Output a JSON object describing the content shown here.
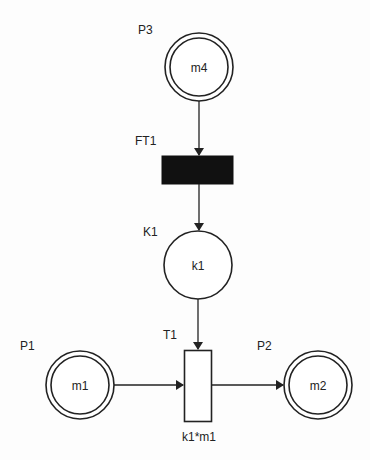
{
  "diagram": {
    "type": "petri-net",
    "places": [
      {
        "id": "P3",
        "label": "P3",
        "token": "m4",
        "double": true
      },
      {
        "id": "K1",
        "label": "K1",
        "token": "k1",
        "double": false
      },
      {
        "id": "P1",
        "label": "P1",
        "token": "m1",
        "double": true
      },
      {
        "id": "P2",
        "label": "P2",
        "token": "m2",
        "double": true
      }
    ],
    "transitions": [
      {
        "id": "FT1",
        "label": "FT1",
        "filled": true,
        "rate": ""
      },
      {
        "id": "T1",
        "label": "T1",
        "filled": false,
        "rate": "k1*m1"
      }
    ],
    "arcs": [
      {
        "from": "P3",
        "to": "FT1"
      },
      {
        "from": "FT1",
        "to": "K1"
      },
      {
        "from": "K1",
        "to": "T1"
      },
      {
        "from": "P1",
        "to": "T1"
      },
      {
        "from": "T1",
        "to": "P2"
      }
    ],
    "colors": {
      "stroke": "#222222",
      "fill_transition": "#111111",
      "background": "#fdfdfd"
    }
  }
}
